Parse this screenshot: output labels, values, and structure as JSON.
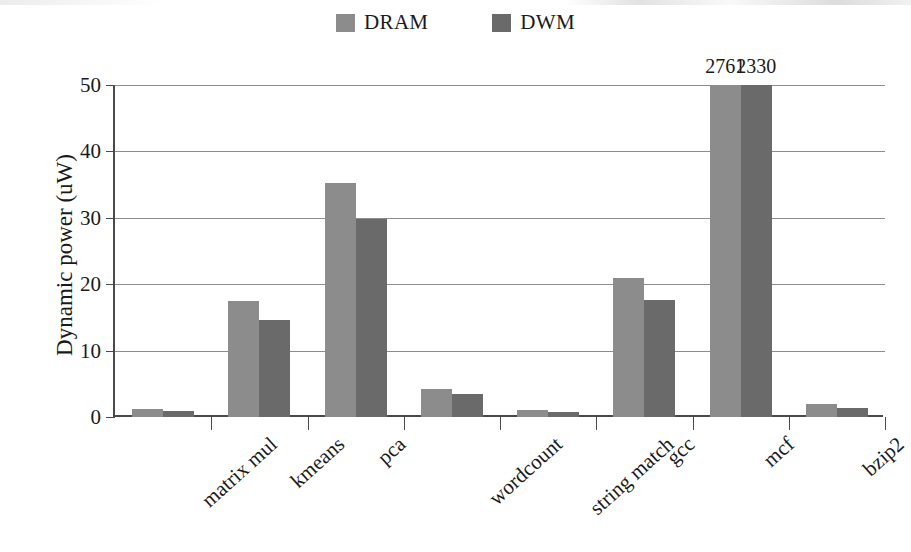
{
  "chart_data": {
    "type": "bar",
    "title": "",
    "subtitle": "",
    "xlabel": "",
    "ylabel": "Dynamic power (uW)",
    "ylim": [
      0,
      50
    ],
    "yticks": [
      0,
      10,
      20,
      30,
      40,
      50
    ],
    "grid": true,
    "legend_position": "top-center",
    "categories": [
      "matrix mul",
      "kmeans",
      "pca",
      "wordcount",
      "string match",
      "gcc",
      "mcf",
      "bzip2"
    ],
    "series": [
      {
        "name": "DRAM",
        "color": "#8c8c8c",
        "values": [
          1.2,
          17.4,
          35.3,
          4.2,
          1.1,
          21.0,
          2761,
          1.9
        ],
        "labels": [
          "",
          "",
          "",
          "",
          "",
          "",
          "2761",
          ""
        ]
      },
      {
        "name": "DWM",
        "color": "#6a6a6a",
        "values": [
          0.9,
          14.6,
          29.8,
          3.4,
          0.8,
          17.6,
          2330,
          1.4
        ],
        "labels": [
          "",
          "",
          "",
          "",
          "",
          "",
          "2330",
          ""
        ]
      }
    ],
    "annotations": [
      {
        "text": "2761",
        "series": "DRAM",
        "category": "mcf",
        "note": "value clipped by axis"
      },
      {
        "text": "2330",
        "series": "DWM",
        "category": "mcf",
        "note": "value clipped by axis"
      }
    ]
  },
  "legend": {
    "items": [
      {
        "label": "DRAM",
        "color": "#8c8c8c"
      },
      {
        "label": "DWM",
        "color": "#6a6a6a"
      }
    ]
  },
  "axes": {
    "y_title": "Dynamic power (uW)",
    "y_ticks": [
      "50",
      "40",
      "30",
      "20",
      "10",
      "0"
    ]
  }
}
